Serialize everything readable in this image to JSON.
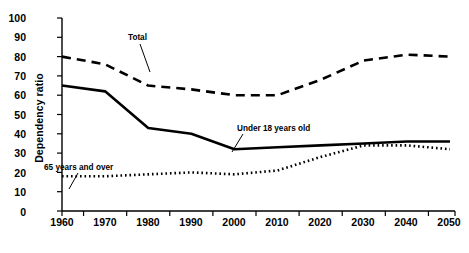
{
  "chart_data": {
    "type": "line",
    "title": "",
    "xlabel": "",
    "ylabel": "Dependency ratio",
    "categories": [
      "1960",
      "1970",
      "1980",
      "1990",
      "2000",
      "2010",
      "2020",
      "2030",
      "2040",
      "2050"
    ],
    "x": [
      1960,
      1970,
      1980,
      1990,
      2000,
      2010,
      2020,
      2030,
      2040,
      2050
    ],
    "ylim": [
      0,
      100
    ],
    "yticks": [
      "0",
      "10",
      "20",
      "30",
      "40",
      "50",
      "60",
      "70",
      "80",
      "90",
      "100"
    ],
    "ytick_values": [
      0,
      10,
      20,
      30,
      40,
      50,
      60,
      70,
      80,
      90,
      100
    ],
    "grid": false,
    "legend_position": "inline-annotations",
    "series": [
      {
        "name": "Total",
        "style": "dashed",
        "values": [
          80,
          76,
          65,
          63,
          60,
          60,
          68,
          78,
          81,
          80
        ]
      },
      {
        "name": "Under 18 years old",
        "style": "solid",
        "values": [
          65,
          62,
          43,
          40,
          32,
          33,
          34,
          35,
          36,
          36
        ]
      },
      {
        "name": "65 years and over",
        "style": "dotted",
        "values": [
          18,
          18,
          19,
          20,
          19,
          21,
          28,
          34,
          34,
          32
        ]
      }
    ],
    "annotations": [
      {
        "text": "Total",
        "series": "Total"
      },
      {
        "text": "Under 18 years old",
        "series": "Under 18 years old"
      },
      {
        "text": "65 years and over",
        "series": "65 years and over"
      }
    ]
  }
}
